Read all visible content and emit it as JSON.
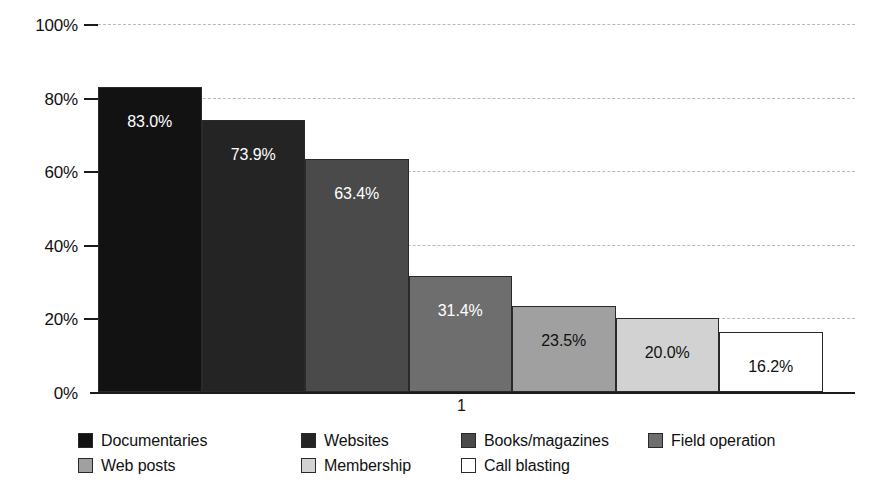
{
  "chart_data": {
    "type": "bar",
    "title": "",
    "subtitle": "",
    "xlabel": "",
    "ylabel": "",
    "categories": [
      "1"
    ],
    "x_tick_labels": [
      "1"
    ],
    "y_tick_labels": [
      "100%",
      "80%",
      "60%",
      "40%",
      "20%",
      "0%"
    ],
    "y_tick_values": [
      100,
      80,
      60,
      40,
      20,
      0
    ],
    "ylim": [
      0,
      100
    ],
    "grid": true,
    "grid_axis": "y",
    "legend_position": "bottom",
    "value_suffix": "%",
    "series": [
      {
        "name": "Documentaries",
        "value": 83.0,
        "label": "83.0%",
        "color": "#121212",
        "label_color": "#ffffff"
      },
      {
        "name": "Websites",
        "value": 73.9,
        "label": "73.9%",
        "color": "#242424",
        "label_color": "#ffffff"
      },
      {
        "name": "Books/magazines",
        "value": 63.4,
        "label": "63.4%",
        "color": "#4a4a4a",
        "label_color": "#ffffff"
      },
      {
        "name": "Field operation",
        "value": 31.4,
        "label": "31.4%",
        "color": "#6e6e6e",
        "label_color": "#ffffff"
      },
      {
        "name": "Web posts",
        "value": 23.5,
        "label": "23.5%",
        "color": "#a0a0a0",
        "label_color": "#111111"
      },
      {
        "name": "Membership",
        "value": 20.0,
        "label": "20.0%",
        "color": "#d2d2d2",
        "label_color": "#111111"
      },
      {
        "name": "Call blasting",
        "value": 16.2,
        "label": "16.2%",
        "color": "#ffffff",
        "label_color": "#111111"
      }
    ]
  },
  "legend": {
    "rows": [
      [
        {
          "label": "Documentaries",
          "color": "#121212",
          "x": 0
        },
        {
          "label": "Documentaries-spacer",
          "skip": true,
          "x": 0
        },
        {
          "label": "Websites",
          "color": "#242424",
          "x": 223
        },
        {
          "label": "Books/magazines",
          "color": "#4a4a4a",
          "x": 383
        },
        {
          "label": "Field operation",
          "color": "#6e6e6e",
          "x": 570
        }
      ],
      [
        {
          "label": "Web posts",
          "color": "#a0a0a0",
          "x": 0
        },
        {
          "label": "Membership",
          "color": "#d2d2d2",
          "x": 223
        },
        {
          "label": "Call blasting",
          "color": "#ffffff",
          "x": 383
        }
      ]
    ]
  }
}
